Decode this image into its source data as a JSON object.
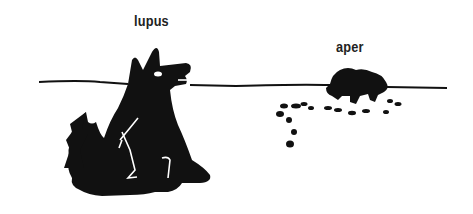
{
  "illustration": {
    "labels": {
      "wolf": "lupus",
      "boar": "aper"
    },
    "colors": {
      "ink": "#111111",
      "background": "#ffffff"
    }
  }
}
